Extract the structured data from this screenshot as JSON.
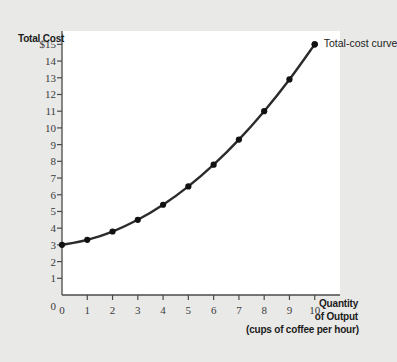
{
  "figure": {
    "background_color": "#e9e9e7",
    "panel_color": "#ffffff",
    "axis_color": "#4a4a4a",
    "curve_color": "#2b2b2b"
  },
  "labels": {
    "y_axis_title": "Total Cost",
    "x_axis_title_line1": "Quantity",
    "x_axis_title_line2": "of Output",
    "x_axis_title_line3": "(cups of coffee per hour)",
    "curve_annotation": "Total-cost curve"
  },
  "chart_data": {
    "type": "line",
    "title": "",
    "xlabel": "Quantity of Output (cups of coffee per hour)",
    "ylabel": "Total Cost",
    "xlim": [
      0,
      11
    ],
    "ylim": [
      0,
      15.8
    ],
    "grid": false,
    "legend": "none",
    "annotations": [
      {
        "text": "Total-cost curve",
        "x": 10,
        "y": 15.0
      }
    ],
    "x_ticks": [
      0,
      1,
      2,
      3,
      4,
      5,
      6,
      7,
      8,
      9,
      10
    ],
    "x_tick_labels": [
      "0",
      "1",
      "2",
      "3",
      "4",
      "5",
      "6",
      "7",
      "8",
      "9",
      "10"
    ],
    "y_ticks": [
      0,
      1,
      2,
      3,
      4,
      5,
      6,
      7,
      8,
      9,
      10,
      11,
      12,
      13,
      14,
      15
    ],
    "y_tick_labels": [
      "0",
      "1",
      "2",
      "3",
      "4",
      "5",
      "6",
      "7",
      "8",
      "9",
      "10",
      "11",
      "12",
      "13",
      "14",
      "$15"
    ],
    "x": [
      0,
      1,
      2,
      3,
      4,
      5,
      6,
      7,
      8,
      9,
      10
    ],
    "values": [
      3.0,
      3.3,
      3.8,
      4.5,
      5.4,
      6.5,
      7.8,
      9.3,
      11.0,
      12.9,
      15.0
    ],
    "series": [
      {
        "name": "Total-cost curve",
        "values": [
          3.0,
          3.3,
          3.8,
          4.5,
          5.4,
          6.5,
          7.8,
          9.3,
          11.0,
          12.9,
          15.0
        ]
      }
    ]
  }
}
